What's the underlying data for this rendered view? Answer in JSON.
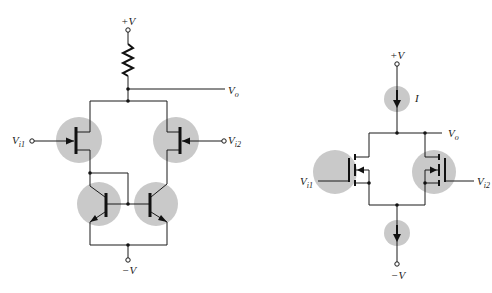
{
  "figure": {
    "left_circuit": {
      "title": "BJT/JFET differential amplifier",
      "supply_pos": "+V",
      "supply_neg": "−V",
      "output": {
        "main": "V",
        "sub": "o"
      },
      "input1": {
        "main": "V",
        "sub": "i1"
      },
      "input2": {
        "main": "V",
        "sub": "i2"
      }
    },
    "right_circuit": {
      "title": "MOSFET differential amplifier",
      "supply_pos": "+V",
      "supply_neg": "−V",
      "current_label": "I",
      "output": {
        "main": "V",
        "sub": "o"
      },
      "input1": {
        "main": "V",
        "sub": "i1"
      },
      "input2": {
        "main": "V",
        "sub": "i2"
      }
    },
    "colors": {
      "wire": "#1a1a1a",
      "highlight": "#c9c9c9",
      "background": "#ffffff"
    }
  }
}
